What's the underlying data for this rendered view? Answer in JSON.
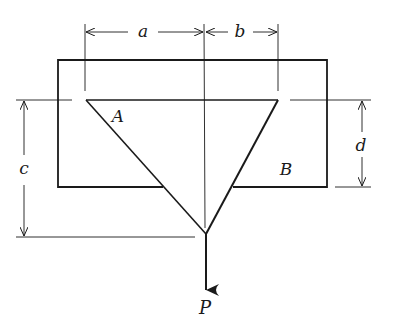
{
  "diagram": {
    "type": "engineering-statics-figure",
    "labels": {
      "a": "a",
      "b": "b",
      "c": "c",
      "d": "d",
      "A": "A",
      "B": "B",
      "P": "P"
    },
    "colors": {
      "stroke": "#1a1a1a",
      "background": "#ffffff"
    },
    "geometry": {
      "plate": {
        "left": 58,
        "top": 60,
        "right": 327,
        "bottom": 187
      },
      "triangle": {
        "vertex_A": [
          86,
          100
        ],
        "vertex_B": [
          278,
          100
        ],
        "apex": [
          206,
          234
        ]
      },
      "load_arrow": {
        "from": [
          206,
          234
        ],
        "to": [
          206,
          292
        ]
      }
    }
  }
}
